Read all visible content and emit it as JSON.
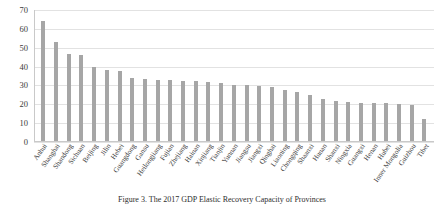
{
  "chart_data": {
    "type": "bar",
    "title": "",
    "caption": "Figure 3. The 2017 GDP Elastic Recovery Capacity of Provinces",
    "xlabel": "",
    "ylabel": "",
    "ylim": [
      0,
      70
    ],
    "yticks": [
      0,
      10,
      20,
      30,
      40,
      50,
      60,
      70
    ],
    "grid": true,
    "legend": "none",
    "bar_color": "#a6a6a6",
    "grid_color": "#e2e2e2",
    "axis_color": "#c9c9c9",
    "categories": [
      "Anhui",
      "Shanghai",
      "Shandong",
      "Sichuan",
      "Beijing",
      "Jilin",
      "Hebei",
      "Guangdong",
      "Gansu",
      "Heilongjiang",
      "Fujian",
      "Zhejiang",
      "Hainan",
      "Xinjiang",
      "Tianjin",
      "Yunnan",
      "Jiangsu",
      "Jiangxi",
      "Qinghai",
      "Liaoning",
      "Chongqing",
      "Shaanxi",
      "Hunan",
      "Shanxi",
      "Ningxia",
      "Guangxi",
      "Henan",
      "Hubei",
      "Inner Mongolia",
      "Guizhou",
      "Tibet"
    ],
    "values": [
      64,
      53,
      46.5,
      46,
      40,
      38,
      37.5,
      34,
      33.5,
      33,
      33,
      32.5,
      32.5,
      32,
      31.5,
      30.5,
      30,
      29.5,
      29,
      27.5,
      26.5,
      25,
      23,
      21.5,
      21,
      20.5,
      20.5,
      20.5,
      20,
      19.5,
      12
    ]
  }
}
